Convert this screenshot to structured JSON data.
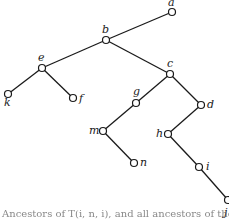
{
  "diagram": {
    "type": "binary-tree",
    "nodes": [
      {
        "id": "a",
        "label": "a",
        "x": 172,
        "y": 12,
        "lx": 168,
        "ly": 6
      },
      {
        "id": "b",
        "label": "b",
        "x": 106,
        "y": 40,
        "lx": 102,
        "ly": 33
      },
      {
        "id": "c",
        "label": "c",
        "x": 170,
        "y": 74,
        "lx": 167,
        "ly": 67
      },
      {
        "id": "d",
        "label": "d",
        "x": 201,
        "y": 105,
        "lx": 207,
        "ly": 108
      },
      {
        "id": "e",
        "label": "e",
        "x": 42,
        "y": 68,
        "lx": 38,
        "ly": 61
      },
      {
        "id": "f",
        "label": "f",
        "x": 73,
        "y": 98,
        "lx": 79,
        "ly": 102
      },
      {
        "id": "g",
        "label": "g",
        "x": 136,
        "y": 103,
        "lx": 133,
        "ly": 95
      },
      {
        "id": "h",
        "label": "h",
        "x": 168,
        "y": 134,
        "lx": 156,
        "ly": 137
      },
      {
        "id": "i",
        "label": "i",
        "x": 199,
        "y": 167,
        "lx": 206,
        "ly": 170
      },
      {
        "id": "j",
        "label": "j",
        "x": 228,
        "y": 200,
        "lx": 224,
        "ly": 216
      },
      {
        "id": "k",
        "label": "k",
        "x": 8,
        "y": 94,
        "lx": 4,
        "ly": 106
      },
      {
        "id": "m",
        "label": "m",
        "x": 103,
        "y": 131,
        "lx": 89,
        "ly": 134
      },
      {
        "id": "n",
        "label": "n",
        "x": 134,
        "y": 163,
        "lx": 140,
        "ly": 166
      }
    ],
    "edges": [
      [
        "a",
        "b"
      ],
      [
        "b",
        "e"
      ],
      [
        "b",
        "c"
      ],
      [
        "e",
        "k"
      ],
      [
        "e",
        "f"
      ],
      [
        "c",
        "g"
      ],
      [
        "c",
        "d"
      ],
      [
        "g",
        "m"
      ],
      [
        "m",
        "n"
      ],
      [
        "d",
        "h"
      ],
      [
        "h",
        "i"
      ],
      [
        "i",
        "j"
      ]
    ],
    "caption": "Ancestors of T(i, n, i), and all ancestors of the tree"
  }
}
